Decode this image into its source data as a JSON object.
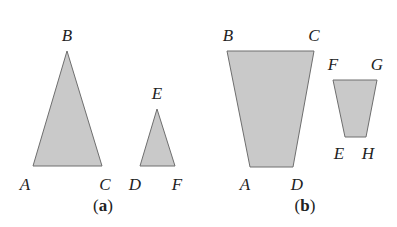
{
  "figure": {
    "fill_color": "#c9c9c9",
    "stroke_color": "#6e6e6e",
    "label_color": "#222222",
    "panels": [
      {
        "id": "a",
        "caption": {
          "open": "(",
          "letter": "a",
          "close": ")",
          "x": 103,
          "y": 207
        },
        "shapes": [
          {
            "name": "triangle-ABC",
            "type": "triangle",
            "points": "33,166 67,51 102,166",
            "vertices": [
              {
                "label": "A",
                "x": 25,
                "y": 186
              },
              {
                "label": "B",
                "x": 67,
                "y": 37
              },
              {
                "label": "C",
                "x": 105,
                "y": 186
              }
            ]
          },
          {
            "name": "triangle-DEF",
            "type": "triangle",
            "points": "140,166 157,109 175,166",
            "vertices": [
              {
                "label": "D",
                "x": 135,
                "y": 186
              },
              {
                "label": "E",
                "x": 157,
                "y": 95
              },
              {
                "label": "F",
                "x": 177,
                "y": 186
              }
            ]
          }
        ]
      },
      {
        "id": "b",
        "caption": {
          "open": "(",
          "letter": "b",
          "close": ")",
          "x": 305,
          "y": 207
        },
        "shapes": [
          {
            "name": "trapezoid-ABCD",
            "type": "quadrilateral",
            "points": "227,51 314,51 293,167 250,167",
            "vertices": [
              {
                "label": "B",
                "x": 228,
                "y": 37
              },
              {
                "label": "C",
                "x": 314,
                "y": 37
              },
              {
                "label": "A",
                "x": 245,
                "y": 186
              },
              {
                "label": "D",
                "x": 297,
                "y": 186
              }
            ]
          },
          {
            "name": "trapezoid-EFGH",
            "type": "quadrilateral",
            "points": "333,80 377,80 366,137 345,137",
            "vertices": [
              {
                "label": "F",
                "x": 333,
                "y": 66
              },
              {
                "label": "G",
                "x": 377,
                "y": 66
              },
              {
                "label": "E",
                "x": 339,
                "y": 155
              },
              {
                "label": "H",
                "x": 368,
                "y": 155
              }
            ]
          }
        ]
      }
    ]
  }
}
